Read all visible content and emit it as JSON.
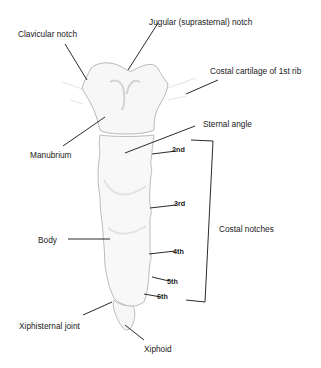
{
  "diagram": {
    "colors": {
      "background": "#ffffff",
      "bone_fill": "#f7f7f7",
      "bone_outline": "#b8b8b8",
      "bone_shading": "#d6d6d6",
      "leader_lines": "#2a2a2a",
      "text": "#1a1a1a"
    },
    "labels": {
      "clavicular_notch": "Clavicular notch",
      "jugular_notch": "Jugular (suprasternal) notch",
      "costal_cartilage_1st_rib": "Costal cartilage of 1st rib",
      "manubrium": "Manubrium",
      "sternal_angle": "Sternal angle",
      "body": "Body",
      "costal_notches": "Costal notches",
      "xiphisternal_joint": "Xiphisternal joint",
      "xiphoid": "Xiphoid"
    },
    "costal_notch_labels": [
      "2nd",
      "3rd",
      "4th",
      "5th",
      "6th"
    ]
  }
}
